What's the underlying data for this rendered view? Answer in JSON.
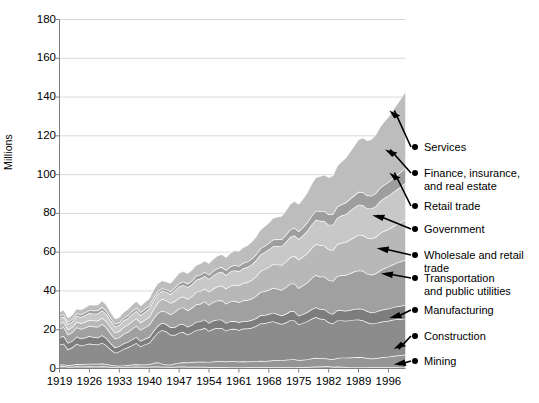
{
  "chart_data": {
    "type": "area",
    "stacked": true,
    "title": "",
    "subtitle": "",
    "xlabel": "",
    "ylabel": "Millions",
    "ylim": [
      0,
      180
    ],
    "xlim": [
      1919,
      2000
    ],
    "yticks": [
      0,
      20,
      40,
      60,
      80,
      100,
      120,
      140,
      160,
      180
    ],
    "xticks": [
      1919,
      1926,
      1933,
      1940,
      1947,
      1954,
      1961,
      1968,
      1975,
      1982,
      1989,
      1996
    ],
    "grid": "horizontal",
    "legend_position": "right-callouts",
    "x": [
      1919,
      1920,
      1921,
      1922,
      1923,
      1924,
      1925,
      1926,
      1927,
      1928,
      1929,
      1930,
      1931,
      1932,
      1933,
      1934,
      1935,
      1936,
      1937,
      1938,
      1939,
      1940,
      1941,
      1942,
      1943,
      1944,
      1945,
      1946,
      1947,
      1948,
      1949,
      1950,
      1951,
      1952,
      1953,
      1954,
      1955,
      1956,
      1957,
      1958,
      1959,
      1960,
      1961,
      1962,
      1963,
      1964,
      1965,
      1966,
      1967,
      1968,
      1969,
      1970,
      1971,
      1972,
      1973,
      1974,
      1975,
      1976,
      1977,
      1978,
      1979,
      1980,
      1981,
      1982,
      1983,
      1984,
      1985,
      1986,
      1987,
      1988,
      1989,
      1990,
      1991,
      1992,
      1993,
      1994,
      1995,
      1996,
      1997,
      1998,
      1999,
      2000
    ],
    "series": [
      {
        "name": "Mining",
        "color": "#a8a8a8",
        "values": [
          1.1,
          1.2,
          0.9,
          0.9,
          1.1,
          1.0,
          1.0,
          1.1,
          1.0,
          1.0,
          1.1,
          1.0,
          0.8,
          0.7,
          0.7,
          0.8,
          0.9,
          0.9,
          1.0,
          0.9,
          0.9,
          0.9,
          1.0,
          1.0,
          0.9,
          0.9,
          0.8,
          0.9,
          1.0,
          1.0,
          0.9,
          0.9,
          0.9,
          0.9,
          0.9,
          0.8,
          0.8,
          0.8,
          0.8,
          0.8,
          0.7,
          0.7,
          0.7,
          0.7,
          0.6,
          0.6,
          0.6,
          0.6,
          0.6,
          0.6,
          0.6,
          0.6,
          0.6,
          0.6,
          0.6,
          0.7,
          0.8,
          0.8,
          0.8,
          0.9,
          1.0,
          1.0,
          1.1,
          1.1,
          0.9,
          1.0,
          0.9,
          0.8,
          0.7,
          0.7,
          0.7,
          0.7,
          0.7,
          0.6,
          0.6,
          0.6,
          0.6,
          0.6,
          0.6,
          0.6,
          0.5,
          0.5
        ]
      },
      {
        "name": "Construction",
        "color": "#959595",
        "values": [
          0.8,
          0.9,
          0.8,
          1.0,
          1.2,
          1.2,
          1.3,
          1.4,
          1.4,
          1.4,
          1.5,
          1.3,
          1.0,
          0.8,
          0.7,
          0.8,
          0.9,
          1.1,
          1.2,
          1.1,
          1.2,
          1.3,
          1.8,
          2.2,
          1.6,
          1.1,
          1.1,
          1.7,
          2.0,
          2.2,
          2.2,
          2.4,
          2.6,
          2.6,
          2.6,
          2.6,
          2.8,
          2.9,
          2.9,
          2.8,
          3.0,
          3.0,
          2.9,
          3.0,
          3.0,
          3.1,
          3.2,
          3.4,
          3.3,
          3.4,
          3.6,
          3.6,
          3.7,
          3.9,
          4.1,
          4.1,
          3.6,
          3.7,
          3.9,
          4.2,
          4.5,
          4.3,
          4.2,
          3.9,
          3.9,
          4.4,
          4.7,
          4.8,
          5.0,
          5.1,
          5.2,
          5.1,
          4.7,
          4.5,
          4.7,
          5.1,
          5.3,
          5.5,
          5.8,
          6.1,
          6.4,
          6.7
        ]
      },
      {
        "name": "Manufacturing",
        "color": "#8c8c8c",
        "values": [
          10.5,
          10.7,
          8.2,
          9.0,
          10.5,
          9.7,
          10.0,
          10.4,
          10.1,
          10.0,
          10.7,
          9.6,
          8.0,
          6.6,
          7.4,
          8.5,
          9.1,
          10.0,
          11.0,
          9.4,
          10.3,
          11.0,
          13.2,
          15.3,
          17.4,
          17.1,
          15.5,
          14.7,
          15.5,
          15.6,
          14.4,
          15.2,
          16.4,
          16.6,
          17.5,
          16.0,
          16.9,
          17.2,
          17.2,
          15.9,
          16.7,
          16.8,
          16.3,
          16.9,
          17.0,
          17.3,
          18.1,
          19.2,
          19.4,
          19.8,
          20.2,
          19.4,
          18.6,
          19.2,
          20.2,
          20.0,
          18.3,
          19.0,
          19.7,
          20.5,
          21.0,
          20.3,
          20.2,
          18.8,
          18.4,
          19.4,
          19.2,
          19.0,
          19.1,
          19.4,
          19.4,
          19.1,
          18.4,
          18.1,
          18.1,
          18.3,
          18.5,
          18.5,
          18.7,
          18.8,
          18.6,
          18.5
        ]
      },
      {
        "name": "Transportation and public utilities",
        "color": "#7d7d7d",
        "values": [
          3.7,
          3.9,
          3.3,
          3.3,
          3.7,
          3.6,
          3.7,
          3.8,
          3.7,
          3.6,
          3.9,
          3.7,
          3.2,
          2.8,
          2.7,
          2.8,
          2.8,
          3.0,
          3.1,
          2.8,
          2.9,
          3.0,
          3.3,
          3.5,
          3.7,
          3.8,
          3.9,
          4.1,
          4.2,
          4.2,
          4.0,
          4.0,
          4.2,
          4.2,
          4.3,
          4.1,
          4.2,
          4.3,
          4.3,
          4.0,
          4.0,
          4.0,
          3.9,
          3.9,
          3.9,
          4.0,
          4.0,
          4.2,
          4.3,
          4.3,
          4.4,
          4.5,
          4.4,
          4.5,
          4.6,
          4.7,
          4.5,
          4.5,
          4.7,
          4.9,
          5.1,
          5.1,
          5.2,
          5.1,
          4.9,
          5.2,
          5.2,
          5.2,
          5.4,
          5.5,
          5.6,
          5.8,
          5.8,
          5.7,
          5.8,
          6.0,
          6.1,
          6.3,
          6.4,
          6.6,
          6.8,
          7.0
        ]
      },
      {
        "name": "Wholesale and retail trade",
        "color": "#a0a0a0",
        "values": [
          4.5,
          4.6,
          4.3,
          4.5,
          4.8,
          4.9,
          5.1,
          5.3,
          5.4,
          5.5,
          5.8,
          5.5,
          5.0,
          4.5,
          4.5,
          4.9,
          5.2,
          5.5,
          5.8,
          5.7,
          5.9,
          6.2,
          6.6,
          6.5,
          6.2,
          6.3,
          6.6,
          7.8,
          8.3,
          8.5,
          8.5,
          8.8,
          9.0,
          9.1,
          9.3,
          9.3,
          9.6,
          9.9,
          10.0,
          9.9,
          10.2,
          10.4,
          10.4,
          10.6,
          10.8,
          11.1,
          11.5,
          12.0,
          12.2,
          12.5,
          12.8,
          13.0,
          13.2,
          13.7,
          14.2,
          14.4,
          14.3,
          14.8,
          15.3,
          16.1,
          16.6,
          16.6,
          16.8,
          16.8,
          17.0,
          17.7,
          18.1,
          18.4,
          18.9,
          19.3,
          19.7,
          19.7,
          19.3,
          19.4,
          19.8,
          20.5,
          21.2,
          21.6,
          22.1,
          22.5,
          23.0,
          23.5
        ]
      },
      {
        "name": "Government",
        "color": "#b8b8b8",
        "values": [
          2.7,
          2.6,
          2.7,
          2.7,
          2.8,
          2.9,
          3.0,
          3.1,
          3.1,
          3.2,
          3.2,
          3.3,
          3.3,
          3.2,
          3.3,
          3.6,
          3.7,
          3.9,
          3.8,
          3.9,
          4.0,
          4.2,
          4.7,
          5.5,
          6.1,
          6.0,
          5.9,
          5.6,
          5.5,
          5.6,
          5.9,
          6.0,
          6.4,
          6.6,
          6.6,
          6.8,
          6.9,
          7.3,
          7.6,
          7.8,
          8.1,
          8.4,
          8.6,
          9.0,
          9.2,
          9.6,
          10.1,
          10.8,
          11.4,
          11.8,
          12.2,
          12.6,
          12.9,
          13.3,
          13.7,
          14.2,
          14.7,
          14.9,
          15.1,
          15.5,
          16.0,
          16.4,
          16.0,
          15.8,
          16.0,
          16.4,
          16.7,
          17.0,
          17.4,
          17.8,
          18.4,
          18.4,
          18.5,
          18.7,
          18.8,
          19.3,
          19.3,
          19.4,
          19.6,
          19.8,
          20.3,
          20.8
        ]
      },
      {
        "name": "Retail trade",
        "color": "#c8c8c8",
        "values": [
          2.8,
          2.9,
          2.7,
          2.9,
          3.1,
          3.2,
          3.3,
          3.5,
          3.6,
          3.7,
          3.9,
          3.7,
          3.4,
          3.1,
          3.1,
          3.3,
          3.5,
          3.7,
          3.9,
          3.8,
          4.0,
          4.2,
          4.5,
          4.4,
          4.2,
          4.3,
          4.6,
          5.4,
          5.8,
          6.0,
          6.0,
          6.2,
          6.3,
          6.4,
          6.5,
          6.6,
          6.8,
          7.0,
          7.1,
          7.0,
          7.3,
          7.4,
          7.4,
          7.6,
          7.8,
          8.0,
          8.3,
          8.6,
          8.8,
          9.0,
          9.3,
          9.5,
          9.7,
          10.0,
          10.4,
          10.6,
          10.6,
          11.0,
          11.5,
          12.1,
          12.5,
          12.5,
          12.6,
          12.7,
          13.1,
          13.7,
          14.1,
          14.4,
          14.8,
          15.2,
          15.5,
          15.5,
          15.3,
          15.5,
          15.9,
          16.4,
          16.9,
          17.2,
          17.6,
          18.0,
          18.4,
          18.8
        ]
      },
      {
        "name": "Finance, insurance, and real estate",
        "color": "#9e9e9e",
        "values": [
          1.1,
          1.2,
          1.2,
          1.2,
          1.3,
          1.4,
          1.5,
          1.5,
          1.6,
          1.6,
          1.7,
          1.6,
          1.5,
          1.4,
          1.3,
          1.4,
          1.4,
          1.5,
          1.5,
          1.5,
          1.5,
          1.5,
          1.5,
          1.4,
          1.3,
          1.3,
          1.4,
          1.6,
          1.8,
          1.8,
          1.9,
          1.9,
          2.0,
          2.1,
          2.1,
          2.2,
          2.3,
          2.4,
          2.4,
          2.5,
          2.6,
          2.7,
          2.7,
          2.8,
          2.8,
          2.9,
          3.0,
          3.1,
          3.2,
          3.3,
          3.4,
          3.5,
          3.6,
          3.8,
          3.9,
          4.0,
          4.0,
          4.1,
          4.3,
          4.5,
          4.7,
          5.0,
          5.1,
          5.3,
          5.5,
          5.7,
          5.8,
          6.0,
          6.2,
          6.3,
          6.6,
          6.7,
          6.6,
          6.6,
          6.7,
          6.9,
          6.9,
          7.0,
          7.2,
          7.4,
          7.6,
          7.7
        ]
      },
      {
        "name": "Services",
        "color": "#bdbdbd",
        "values": [
          2.0,
          2.1,
          2.0,
          2.1,
          2.3,
          2.4,
          2.5,
          2.7,
          2.8,
          2.9,
          3.1,
          3.0,
          2.8,
          2.6,
          2.7,
          2.9,
          3.0,
          3.2,
          3.4,
          3.3,
          3.5,
          3.7,
          3.9,
          4.0,
          3.9,
          3.9,
          4.2,
          4.7,
          5.1,
          5.2,
          5.2,
          5.4,
          5.5,
          5.6,
          5.7,
          5.8,
          6.1,
          6.3,
          6.5,
          6.6,
          6.9,
          7.4,
          7.6,
          7.9,
          8.3,
          8.7,
          9.0,
          9.5,
          10.0,
          10.4,
          11.0,
          11.5,
          11.8,
          12.3,
          13.0,
          13.5,
          13.9,
          14.6,
          15.3,
          16.3,
          17.1,
          17.9,
          18.6,
          19.0,
          19.7,
          20.8,
          21.9,
          22.9,
          24.2,
          25.5,
          26.9,
          28.0,
          28.3,
          29.0,
          30.0,
          31.2,
          32.4,
          33.6,
          35.0,
          36.4,
          37.8,
          39.3
        ]
      }
    ],
    "callouts": [
      {
        "label": "Services",
        "anchor_year": 1996,
        "anchor_value": 133
      },
      {
        "label": "Finance, insurance,\nand real estate",
        "anchor_year": 1995,
        "anchor_value": 113
      },
      {
        "label": "Retail trade",
        "anchor_year": 1996,
        "anchor_value": 101
      },
      {
        "label": "Government",
        "anchor_year": 1992,
        "anchor_value": 79
      },
      {
        "label": "Wholesale and retail\ntrade",
        "anchor_year": 1993,
        "anchor_value": 62
      },
      {
        "label": "Transportation\nand public utilities",
        "anchor_year": 1994,
        "anchor_value": 49
      },
      {
        "label": "Manufacturing",
        "anchor_year": 1996,
        "anchor_value": 26
      },
      {
        "label": "Construction",
        "anchor_year": 1997,
        "anchor_value": 10
      },
      {
        "label": "Mining",
        "anchor_year": 1997,
        "anchor_value": 2
      }
    ]
  },
  "axes": {
    "y_axis_title": "Millions",
    "y_tick_labels": [
      "180",
      "160",
      "140",
      "120",
      "100",
      "80",
      "60",
      "40",
      "20",
      "0"
    ],
    "x_tick_labels": [
      "1919",
      "1926",
      "1933",
      "1940",
      "1947",
      "1954",
      "1961",
      "1968",
      "1975",
      "1982",
      "1989",
      "1996"
    ]
  },
  "legend": {
    "items": [
      {
        "label": "Services"
      },
      {
        "label": "Finance, insurance,\nand real estate"
      },
      {
        "label": "Retail trade"
      },
      {
        "label": "Government"
      },
      {
        "label": "Wholesale and retail\ntrade"
      },
      {
        "label": "Transportation\nand public utilities"
      },
      {
        "label": "Manufacturing"
      },
      {
        "label": "Construction"
      },
      {
        "label": "Mining"
      }
    ]
  },
  "style": {
    "background": "#ffffff",
    "grid_color": "#d9d9d9",
    "axis_color": "#808080",
    "text_color": "#000000",
    "band_separator": "#ffffff"
  }
}
